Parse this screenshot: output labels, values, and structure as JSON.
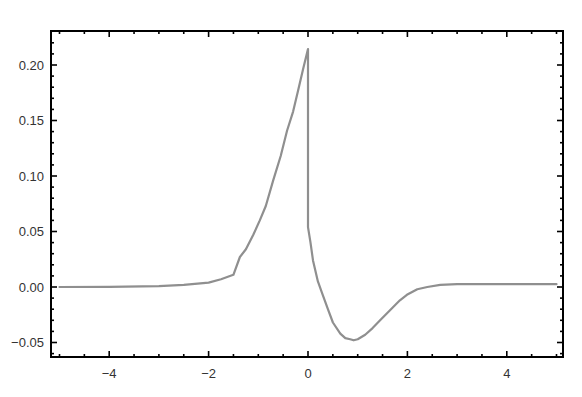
{
  "chart_data": {
    "type": "line",
    "title": "",
    "xlabel": "",
    "ylabel": "",
    "xlim": [
      -5.15,
      5.15
    ],
    "ylim": [
      -0.063,
      0.2306
    ],
    "grid": false,
    "legend": null,
    "frame": true,
    "x_ticks": [
      -4,
      -2,
      0,
      2,
      4
    ],
    "x_tick_labels": [
      "-4",
      "-2",
      "0",
      "2",
      "4"
    ],
    "y_ticks": [
      -0.05,
      0.0,
      0.05,
      0.1,
      0.15,
      0.2
    ],
    "y_tick_labels": [
      "-0.05",
      "0.00",
      "0.05",
      "0.10",
      "0.15",
      "0.20"
    ],
    "line_color": "#8f8f8f",
    "frame_color": "#000000",
    "series": [
      {
        "name": "f(x)",
        "x": [
          -5.0,
          -4.0,
          -3.0,
          -2.5,
          -2.0,
          -1.75,
          -1.5,
          -1.37,
          -1.25,
          -1.1,
          -0.97,
          -0.85,
          -0.7,
          -0.55,
          -0.42,
          -0.3,
          -0.2,
          -0.1,
          0.0,
          0.0,
          0.05,
          0.1,
          0.2,
          0.28,
          0.4,
          0.5,
          0.65,
          0.75,
          0.85,
          0.92,
          1.0,
          1.15,
          1.3,
          1.45,
          1.65,
          1.85,
          1.99,
          2.2,
          2.4,
          2.66,
          3.0,
          3.5,
          4.0,
          5.0
        ],
        "y": [
          0.0,
          0.0002,
          0.0008,
          0.002,
          0.004,
          0.007,
          0.011,
          0.027,
          0.034,
          0.047,
          0.06,
          0.073,
          0.096,
          0.118,
          0.141,
          0.158,
          0.177,
          0.196,
          0.2144,
          0.054,
          0.04,
          0.024,
          0.005,
          -0.005,
          -0.02,
          -0.032,
          -0.042,
          -0.046,
          -0.047,
          -0.048,
          -0.047,
          -0.043,
          -0.037,
          -0.03,
          -0.021,
          -0.012,
          -0.007,
          -0.002,
          0.0,
          0.002,
          0.0025,
          0.0025,
          0.0025,
          0.0025
        ]
      }
    ]
  }
}
